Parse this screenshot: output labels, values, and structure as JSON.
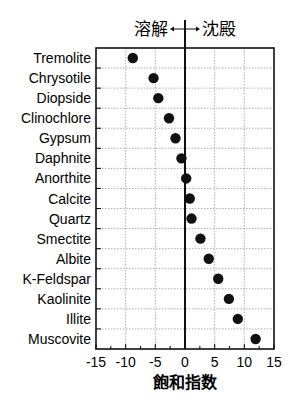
{
  "chart_data": {
    "type": "scatter",
    "title": "",
    "header_left": "溶解",
    "header_right": "沈殿",
    "xlabel": "飽和指数",
    "ylabel": "",
    "xlim": [
      -15,
      15
    ],
    "xticks": [
      -15,
      -10,
      -5,
      0,
      5,
      10,
      15
    ],
    "grid": true,
    "categories": [
      "Tremolite",
      "Chrysotile",
      "Diopside",
      "Clinochlore",
      "Gypsum",
      "Daphnite",
      "Anorthite",
      "Calcite",
      "Quartz",
      "Smectite",
      "Albite",
      "K-Feldspar",
      "Kaolinite",
      "Illite",
      "Muscovite"
    ],
    "values": [
      -8.8,
      -5.3,
      -4.5,
      -2.7,
      -1.6,
      -0.6,
      0.2,
      0.8,
      1.1,
      2.6,
      4.0,
      5.6,
      7.4,
      8.9,
      11.9
    ],
    "colors": {
      "marker": "#111111",
      "zero_line": "#111111",
      "grid": "#9a9a9a",
      "axis": "#111111"
    }
  }
}
